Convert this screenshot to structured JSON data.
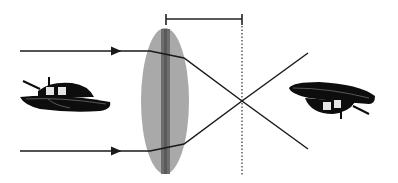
{
  "diagram": {
    "colors": {
      "background": "#ffffff",
      "lens_fill": "#a9a9a9",
      "lens_core": "#6e6e6e",
      "ray": "#1a1a1a",
      "focal_marker": "#222222",
      "object": "#0d0d0d"
    },
    "elements": {
      "object": "boat-object-icon",
      "image": "boat-image-inverted-icon",
      "lens": "convex-lens",
      "focal_bracket": "focal-length-bracket",
      "focal_plane": "focal-plane-dotted-line",
      "rays": [
        "ray-top",
        "ray-bottom"
      ]
    }
  }
}
